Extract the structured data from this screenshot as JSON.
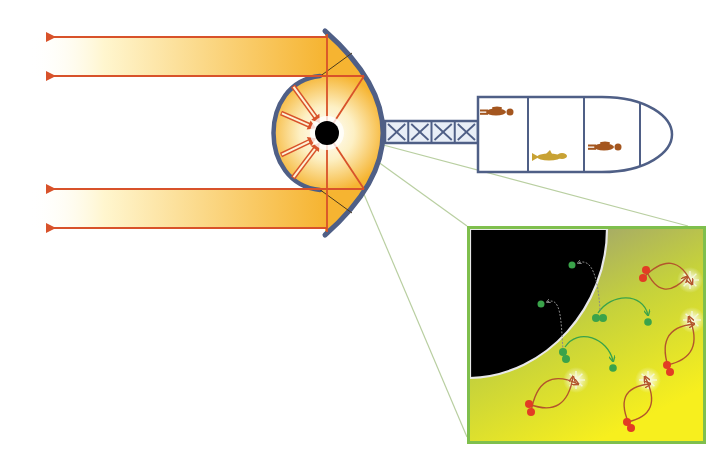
{
  "diagram": {
    "colors": {
      "background": "#ffffff",
      "beam_warm": "#f6b431",
      "beam_fade": "#fff6cf",
      "ray": "#d8522a",
      "structure": "#4f5f86",
      "black_hole": "#000000",
      "leader_line": "#b9cfa1",
      "inset_border": "#7fbf4d",
      "inset_grad_top": "#8f8f86",
      "inset_grad_bottom": "#f7ef1e",
      "horizon_edge": "#e8e8e8",
      "particle_green": "#3aa34a",
      "particle_red": "#e23c24",
      "loop_red": "#b3552c",
      "flash": "#f5f7d6",
      "crew_brown": "#a4561f",
      "crew_gold": "#c8a234"
    },
    "reflector": {
      "outer_top": [
        325,
        31
      ],
      "outer_bottom": [
        325,
        235
      ],
      "outer_bulge_x": 383,
      "inner_top": [
        320,
        76
      ],
      "inner_bottom": [
        320,
        190
      ],
      "inner_left_x": 272
    },
    "black_hole": {
      "cx": 327,
      "cy": 133,
      "r": 12
    },
    "beams": [
      {
        "y_top": 37,
        "y_bottom": 76
      },
      {
        "y_top": 189,
        "y_bottom": 228
      }
    ],
    "output_rays_y": [
      37,
      76,
      189,
      228
    ],
    "ray_arrow_tip_x": 50,
    "truss": {
      "x": 385,
      "y": 121,
      "width": 93,
      "height": 22,
      "cells": 4
    },
    "capsule": {
      "x": 478,
      "y": 97,
      "width": 194,
      "height": 75,
      "dividers_x": [
        528,
        584,
        640
      ],
      "crew": [
        {
          "kind": "person",
          "x": 480,
          "y": 112,
          "color_key": "crew_brown"
        },
        {
          "kind": "animal",
          "x": 532,
          "y": 157,
          "color_key": "crew_gold"
        },
        {
          "kind": "person",
          "x": 588,
          "y": 147,
          "color_key": "crew_brown"
        }
      ]
    },
    "inset": {
      "x": 467,
      "y": 226,
      "width": 239,
      "height": 218,
      "label": "Hawking radiation at the event horizon",
      "green_pairs": [
        {
          "pair": [
            [
              596,
              318
            ],
            [
              603,
              318
            ]
          ],
          "escape": [
            648,
            322
          ],
          "captured": [
            572,
            265
          ]
        },
        {
          "pair": [
            [
              563,
              352
            ],
            [
              566,
              359
            ]
          ],
          "escape": [
            613,
            368
          ],
          "captured": [
            541,
            304
          ]
        }
      ],
      "red_loops": [
        {
          "pair": [
            [
              646,
              270
            ],
            [
              643,
              278
            ]
          ],
          "flash": [
            690,
            280
          ]
        },
        {
          "pair": [
            [
              667,
              365
            ],
            [
              670,
              372
            ]
          ],
          "flash": [
            692,
            320
          ]
        },
        {
          "pair": [
            [
              529,
              404
            ],
            [
              531,
              412
            ]
          ],
          "flash": [
            576,
            380
          ]
        },
        {
          "pair": [
            [
              627,
              422
            ],
            [
              631,
              428
            ]
          ],
          "flash": [
            648,
            380
          ]
        }
      ]
    },
    "leader_lines": [
      {
        "from": [
          338,
          133
        ],
        "to": [
          467,
          226
        ]
      },
      {
        "from": [
          338,
          133
        ],
        "to": [
          467,
          437
        ]
      },
      {
        "from": [
          338,
          133
        ],
        "to": [
          688,
          226
        ]
      }
    ]
  }
}
